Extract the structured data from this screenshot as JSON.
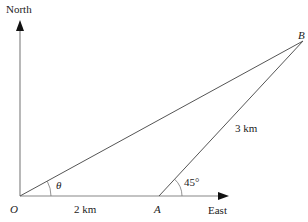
{
  "diagram": {
    "type": "bearing-triangle",
    "axes": {
      "north_label": "North",
      "east_label": "East"
    },
    "points": {
      "O": {
        "label": "O",
        "x": 20,
        "y": 196
      },
      "A": {
        "label": "A",
        "x": 159,
        "y": 196
      },
      "B": {
        "label": "B",
        "x": 303,
        "y": 41
      }
    },
    "segments": {
      "OA_length": "2 km",
      "AB_length": "3 km"
    },
    "angles": {
      "at_O": "θ",
      "at_A": "45°"
    },
    "colors": {
      "line": "#555555",
      "axis": "#888888",
      "text": "#222222"
    }
  }
}
